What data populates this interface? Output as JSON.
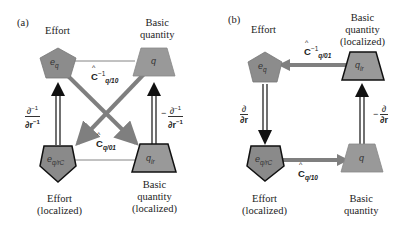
{
  "colors": {
    "node_fill": "#8a8a8a",
    "node_fill_light": "#a9a9a9",
    "arrow_gray": "#7f7f7f",
    "arrow_black": "#111111",
    "line_thin": "#555555"
  },
  "panel_a": {
    "label": "(a)",
    "effort_label": "Effort",
    "basic_label_1": "Basic",
    "basic_label_2": "quantity",
    "effort_loc_1": "Effort",
    "effort_loc_2": "(localized)",
    "basic_loc_1": "Basic",
    "basic_loc_2": "quantity",
    "basic_loc_3": "(localized)",
    "node_eq": "e",
    "node_eq_sub": "q",
    "node_q": "q",
    "node_eqrc": "e",
    "node_eqrc_sub": "q/rC",
    "node_qir": "q",
    "node_qir_sub": "ir",
    "op_top": "C",
    "op_top_sup": "−1",
    "op_top_sub": "q/10",
    "op_bottom": "C",
    "op_bottom_sub": "q/01",
    "left_frac_num": "∂",
    "left_frac_num_sup": "−1",
    "left_frac_den": "∂r",
    "left_frac_den_sup": "−1",
    "right_sign": "−",
    "right_frac_num": "∂",
    "right_frac_num_sup": "−1",
    "right_frac_den": "∂r",
    "right_frac_den_sup": "−1"
  },
  "panel_b": {
    "label": "(b)",
    "effort_label": "Effort",
    "basic_loc_1": "Basic",
    "basic_loc_2": "quantity",
    "basic_loc_3": "(localized)",
    "effort_loc_1": "Effort",
    "effort_loc_2": "(localized)",
    "basic_label_1": "Basic",
    "basic_label_2": "quantity",
    "node_eq": "e",
    "node_eq_sub": "q",
    "node_qir": "q",
    "node_qir_sub": "ir",
    "node_eqrc": "e",
    "node_eqrc_sub": "q/rC",
    "node_q": "q",
    "op_top": "C",
    "op_top_sup": "−1",
    "op_top_sub": "q/01",
    "op_bottom": "C",
    "op_bottom_sub": "q/10",
    "left_frac_num": "∂",
    "left_frac_den": "∂r",
    "right_sign": "−",
    "right_frac_num": "∂",
    "right_frac_den": "∂r"
  }
}
